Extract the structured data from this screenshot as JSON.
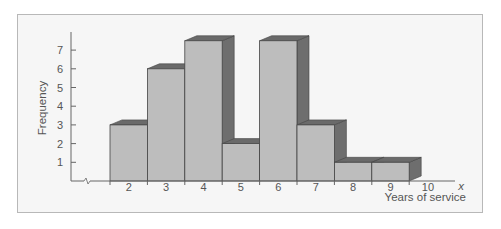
{
  "chart_data": {
    "type": "bar",
    "style": "3d-histogram",
    "title": "",
    "xlabel": "Years of service",
    "xvar": "x",
    "ylabel": "Frequency",
    "categories": [
      "2",
      "3",
      "4",
      "5",
      "6",
      "7",
      "8",
      "9"
    ],
    "values": [
      3,
      6,
      7.5,
      2,
      7.5,
      3,
      1,
      1
    ],
    "x_ticks": [
      "2",
      "3",
      "4",
      "5",
      "6",
      "7",
      "8",
      "9",
      "10"
    ],
    "y_ticks": [
      "1",
      "2",
      "3",
      "4",
      "5",
      "6",
      "7"
    ],
    "ylim": [
      0,
      8
    ],
    "grid": false,
    "legend": null,
    "axis_break": true
  },
  "colors": {
    "frame_bg": "#f6f6f6",
    "bar_front": "#bdbdbd",
    "bar_top": "#6a6a6a",
    "bar_side": "#6e6e6e",
    "axis": "#666666",
    "text": "#555555"
  }
}
